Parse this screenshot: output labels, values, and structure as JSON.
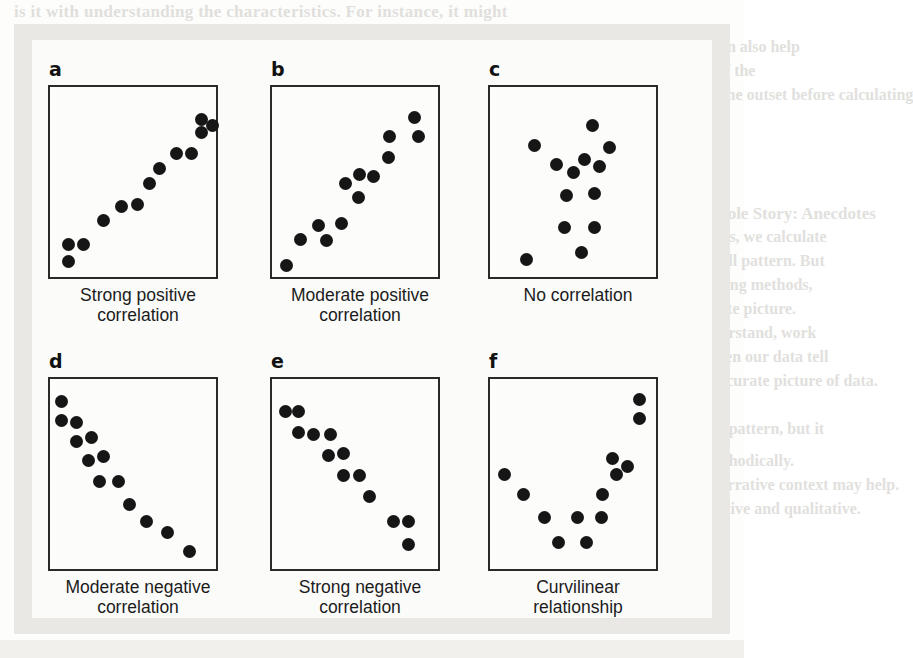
{
  "figure": {
    "panel_count": 6
  },
  "background_text": {
    "top": "is it with understanding the characteristics. For instance, it might",
    "r1": "is objectives, and potential impacts can also help",
    "r2": "readers understand the significance of the",
    "r3": "should always create a scatterplot at the outset before calculating",
    "r4": "measures of correlation.",
    "heading": "Make the Numbers Don't Tell the Whole Story: Anecdotes",
    "r5": "Often, when we have a group of numbers, we calculate",
    "r6": "summary statistics to describe the overall pattern. But",
    "r7": "numbers from the data, based on sampling methods,",
    "r8": "may sometimes give us a far less complete picture.",
    "r9": "Examples, especially ones easier to understand, work",
    "r10": "well. Like an outlier, or a picture, or when our data tell",
    "r11": "us a story. Each of us paints the most accurate picture of data.",
    "b1": "Sketch a line of best fit through a linear pattern, but it",
    "b2": "should be approached carefully and methodically.",
    "b3": "Numbers alone have their uses, but a narrative context may help.",
    "b4": "It is important to balance both quantitative and qualitative.",
    "b5": "statistical summaries with illustrative examples when reporting.",
    "b6": "data analysis results to a general audience of readers."
  },
  "chart_data": [
    {
      "id": "panel-a",
      "letter": "a",
      "type": "scatter",
      "title": "Strong positive correlation",
      "caption_lines": [
        "Strong positive",
        "correlation"
      ],
      "xlim": [
        0,
        100
      ],
      "ylim": [
        0,
        100
      ],
      "grid": false,
      "legend": "none",
      "point_color": "#161616",
      "points": [
        {
          "x": 11,
          "y": 17
        },
        {
          "x": 11,
          "y": 8
        },
        {
          "x": 20,
          "y": 17
        },
        {
          "x": 32,
          "y": 30
        },
        {
          "x": 43,
          "y": 37
        },
        {
          "x": 53,
          "y": 38
        },
        {
          "x": 60,
          "y": 49
        },
        {
          "x": 66,
          "y": 57
        },
        {
          "x": 76,
          "y": 65
        },
        {
          "x": 85,
          "y": 65
        },
        {
          "x": 91,
          "y": 83
        },
        {
          "x": 91,
          "y": 76
        },
        {
          "x": 98,
          "y": 80
        }
      ]
    },
    {
      "id": "panel-b",
      "letter": "b",
      "type": "scatter",
      "title": "Moderate positive correlation",
      "caption_lines": [
        "Moderate positive",
        "correlation"
      ],
      "xlim": [
        0,
        100
      ],
      "ylim": [
        0,
        100
      ],
      "grid": false,
      "legend": "none",
      "point_color": "#161616",
      "points": [
        {
          "x": 9,
          "y": 6
        },
        {
          "x": 17,
          "y": 20
        },
        {
          "x": 28,
          "y": 27
        },
        {
          "x": 33,
          "y": 19
        },
        {
          "x": 42,
          "y": 28
        },
        {
          "x": 44,
          "y": 49
        },
        {
          "x": 52,
          "y": 42
        },
        {
          "x": 53,
          "y": 54
        },
        {
          "x": 61,
          "y": 53
        },
        {
          "x": 70,
          "y": 63
        },
        {
          "x": 71,
          "y": 74
        },
        {
          "x": 86,
          "y": 84
        },
        {
          "x": 88,
          "y": 74
        }
      ]
    },
    {
      "id": "panel-c",
      "letter": "c",
      "type": "scatter",
      "title": "No correlation",
      "caption_lines": [
        "No correlation"
      ],
      "xlim": [
        0,
        100
      ],
      "ylim": [
        0,
        100
      ],
      "grid": false,
      "legend": "none",
      "point_color": "#161616",
      "points": [
        {
          "x": 27,
          "y": 69
        },
        {
          "x": 40,
          "y": 59
        },
        {
          "x": 50,
          "y": 55
        },
        {
          "x": 46,
          "y": 43
        },
        {
          "x": 57,
          "y": 62
        },
        {
          "x": 62,
          "y": 80
        },
        {
          "x": 66,
          "y": 58
        },
        {
          "x": 72,
          "y": 68
        },
        {
          "x": 63,
          "y": 44
        },
        {
          "x": 45,
          "y": 26
        },
        {
          "x": 63,
          "y": 26
        },
        {
          "x": 55,
          "y": 13
        },
        {
          "x": 22,
          "y": 9
        }
      ]
    },
    {
      "id": "panel-d",
      "letter": "d",
      "type": "scatter",
      "title": "Moderate negative correlation",
      "caption_lines": [
        "Moderate negative",
        "correlation"
      ],
      "xlim": [
        0,
        100
      ],
      "ylim": [
        0,
        100
      ],
      "grid": false,
      "legend": "none",
      "point_color": "#161616",
      "points": [
        {
          "x": 7,
          "y": 88
        },
        {
          "x": 7,
          "y": 78
        },
        {
          "x": 16,
          "y": 77
        },
        {
          "x": 16,
          "y": 67
        },
        {
          "x": 25,
          "y": 69
        },
        {
          "x": 23,
          "y": 57
        },
        {
          "x": 32,
          "y": 59
        },
        {
          "x": 30,
          "y": 46
        },
        {
          "x": 41,
          "y": 46
        },
        {
          "x": 48,
          "y": 34
        },
        {
          "x": 58,
          "y": 25
        },
        {
          "x": 71,
          "y": 19
        },
        {
          "x": 84,
          "y": 9
        }
      ]
    },
    {
      "id": "panel-e",
      "letter": "e",
      "type": "scatter",
      "title": "Strong negative correlation",
      "caption_lines": [
        "Strong negative",
        "correlation"
      ],
      "xlim": [
        0,
        100
      ],
      "ylim": [
        0,
        100
      ],
      "grid": false,
      "legend": "none",
      "point_color": "#161616",
      "points": [
        {
          "x": 8,
          "y": 83
        },
        {
          "x": 16,
          "y": 83
        },
        {
          "x": 16,
          "y": 72
        },
        {
          "x": 25,
          "y": 71
        },
        {
          "x": 35,
          "y": 71
        },
        {
          "x": 34,
          "y": 60
        },
        {
          "x": 43,
          "y": 61
        },
        {
          "x": 43,
          "y": 49
        },
        {
          "x": 53,
          "y": 49
        },
        {
          "x": 59,
          "y": 38
        },
        {
          "x": 73,
          "y": 25
        },
        {
          "x": 82,
          "y": 25
        },
        {
          "x": 82,
          "y": 13
        }
      ]
    },
    {
      "id": "panel-f",
      "letter": "f",
      "type": "scatter",
      "title": "Curvilinear relationship",
      "caption_lines": [
        "Curvilinear",
        "relationship"
      ],
      "xlim": [
        0,
        100
      ],
      "ylim": [
        0,
        100
      ],
      "grid": false,
      "legend": "none",
      "point_color": "#161616",
      "points": [
        {
          "x": 9,
          "y": 50
        },
        {
          "x": 20,
          "y": 39
        },
        {
          "x": 33,
          "y": 27
        },
        {
          "x": 41,
          "y": 14
        },
        {
          "x": 53,
          "y": 27
        },
        {
          "x": 58,
          "y": 14
        },
        {
          "x": 67,
          "y": 27
        },
        {
          "x": 68,
          "y": 39
        },
        {
          "x": 76,
          "y": 50
        },
        {
          "x": 74,
          "y": 58
        },
        {
          "x": 83,
          "y": 54
        },
        {
          "x": 90,
          "y": 79
        },
        {
          "x": 90,
          "y": 89
        }
      ]
    }
  ]
}
